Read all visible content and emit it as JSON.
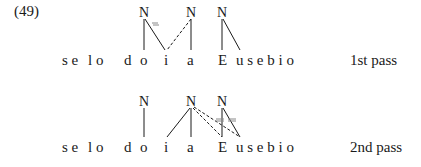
{
  "example_number": "(49)",
  "panels": [
    {
      "label": "1st pass",
      "nodes": [
        "N",
        "N",
        "N"
      ],
      "segments": [
        "s e",
        "l o",
        "d",
        "o",
        "i",
        "a",
        "E",
        "u s e b i o"
      ]
    },
    {
      "label": "2nd pass",
      "nodes": [
        "N",
        "N",
        "N"
      ],
      "segments": [
        "s e",
        "l o",
        "d",
        "o",
        "i",
        "a",
        "E",
        "u s e b i o"
      ]
    }
  ]
}
